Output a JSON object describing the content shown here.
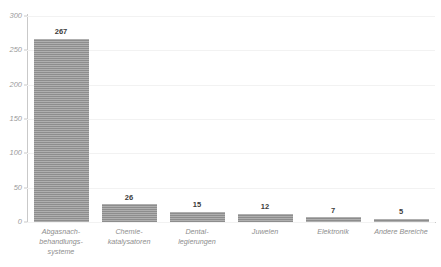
{
  "chart_data": {
    "type": "bar",
    "title": "",
    "subtitle": "",
    "xlabel": "",
    "ylabel": "",
    "ylim": [
      0,
      300
    ],
    "y_ticks": [
      0,
      50,
      100,
      150,
      200,
      250,
      300
    ],
    "grid": true,
    "legend": "none",
    "orientation": "vertical",
    "categories": [
      "Abgasnach-\nbehandlungs-\nsysteme",
      "Chemie-\nkatalysatoren",
      "Dental-\nlegierungen",
      "Juwelen",
      "Elektronik",
      "Andere Bereiche"
    ],
    "values": [
      267,
      26,
      15,
      12,
      7,
      5
    ],
    "value_labels": [
      "267",
      "26",
      "15",
      "12",
      "7",
      "5"
    ],
    "bar_color": "#8d8d8d",
    "axis_color": "#c9c9c9",
    "gridline_color": "#f2f2f2",
    "tick_label_color": "#9a9a9a",
    "value_label_color": "#3b3b3b"
  },
  "source_note": ""
}
